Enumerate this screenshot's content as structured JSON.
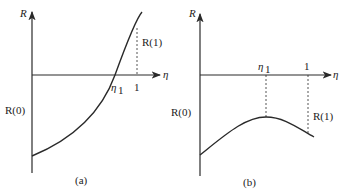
{
  "panel_a": {
    "y_axis_label": "R",
    "x_axis_label": "η",
    "root_label": "η",
    "root_sub": "1",
    "tick_one": "1",
    "r1_label": "R(1)",
    "r0_label": "R(0)",
    "caption": "(a)"
  },
  "panel_b": {
    "y_axis_label": "R",
    "x_axis_label": "η",
    "peak_label": "η",
    "peak_sub": "1",
    "tick_one": "1",
    "r1_label": "R(1)",
    "r0_label": "R(0)",
    "caption": "(b)"
  },
  "colors": {
    "stroke": "#2a2a2a"
  }
}
